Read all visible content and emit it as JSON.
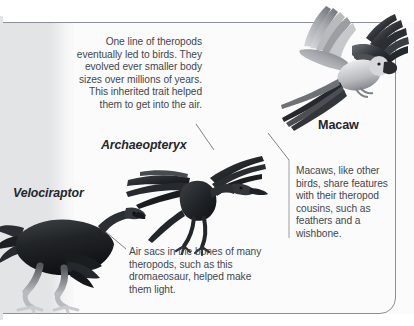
{
  "figure": {
    "type": "annotated-illustration",
    "background": {
      "left_band_color": "#e3e4e6",
      "right_panel_color": "#fbfbfb",
      "frame_color": "#8b8f96"
    },
    "text_color": "#3f4650"
  },
  "callouts": {
    "theropods": "One line of theropods eventually led to birds. They evolved ever smaller body sizes over millions of years. This inherited trait helped them to get into the air.",
    "macaw": "Macaws, like other birds, share features with their theropod cousins, such as feathers and a wishbone.",
    "air_sacs": "Air sacs in the bones of many theropods, such as this dromaeosaur, helped make them light."
  },
  "labels": {
    "velociraptor": "Velociraptor",
    "archaeopteryx": "Archaeopteryx",
    "macaw": "Macaw"
  }
}
